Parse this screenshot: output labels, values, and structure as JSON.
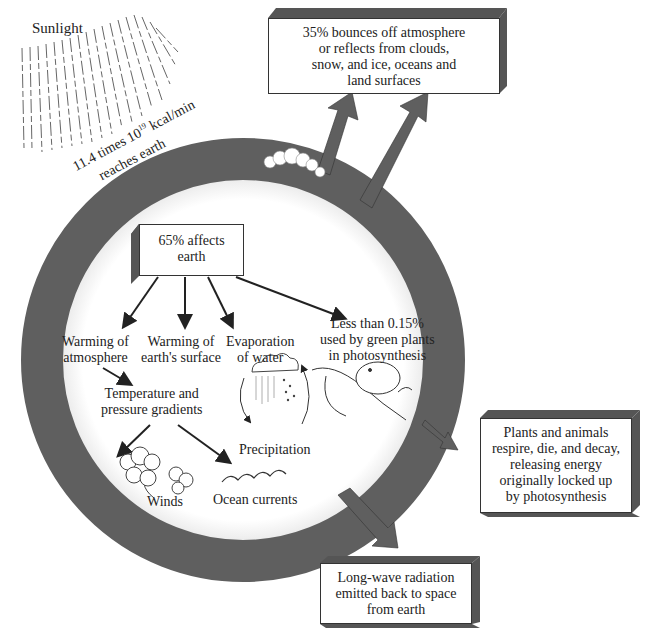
{
  "colors": {
    "ring": "#5f5f5f",
    "box_side": "#555555",
    "text": "#222222",
    "background": "#ffffff"
  },
  "sunlight": {
    "label": "Sunlight",
    "amount_line1_prefix": "11.4 times 10",
    "amount_line1_exp": "19",
    "amount_line1_suffix": " kcal/min",
    "amount_line2": "reaches earth"
  },
  "boxes": {
    "reflected": {
      "lines": [
        "35% bounces off atmosphere",
        "or reflects from clouds,",
        "snow, and ice, oceans and",
        "land surfaces"
      ]
    },
    "affects_earth": {
      "lines": [
        "65% affects",
        "earth"
      ]
    },
    "decay": {
      "lines": [
        "Plants and animals",
        "respire, die, and decay,",
        "releasing energy",
        "originally locked up",
        "by photosynthesis"
      ]
    },
    "longwave": {
      "lines": [
        "Long-wave radiation",
        "emitted back to space",
        "from earth"
      ]
    }
  },
  "effects": [
    {
      "id": "atmosphere",
      "lines": [
        "Warming of",
        "atmosphere"
      ]
    },
    {
      "id": "surface",
      "lines": [
        "Warming of",
        "earth's surface"
      ]
    },
    {
      "id": "evaporation",
      "lines": [
        "Evaporation",
        "of water"
      ]
    },
    {
      "id": "photosynthesis",
      "lines": [
        "Less than 0.15%",
        "used by green plants",
        "in photosynthesis"
      ]
    }
  ],
  "secondary": {
    "gradients": [
      "Temperature and",
      "pressure gradients"
    ],
    "precipitation": "Precipitation",
    "winds": "Winds",
    "ocean_currents": "Ocean currents"
  },
  "icons": [
    "sun-rays-icon",
    "cloud-icon",
    "rain-cloud-icon",
    "wind-cloud-icon",
    "ocean-wave-icon",
    "mouse-on-plant-icon",
    "arrow-icon"
  ]
}
